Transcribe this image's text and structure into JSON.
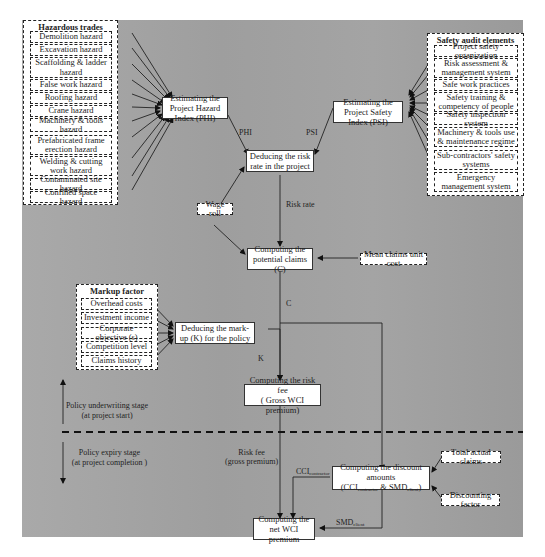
{
  "hazardous_trades": {
    "title": "Hazardous trades",
    "items": [
      "Demolition hazard",
      "Excavation hazard",
      "Scaffolding & ladder hazard",
      "False work hazard",
      "Roofing hazard",
      "Crane hazard",
      "Machinery & tools hazard",
      "Prefabricated frame erection hazard",
      "Welding & cutting work hazard",
      "Contaminated site hazard",
      "Confined space hazard"
    ]
  },
  "safety_audit": {
    "title": "Safety audit elements",
    "items": [
      "Project safety organization",
      "Risk assessment & management system",
      "Safe work practices",
      "Safety training & competency of people",
      "Safety inspection system",
      "Machinery & tools use & maintenance regime",
      "Sub-contractors' safety systems",
      "Emergency management system"
    ]
  },
  "markup_factor": {
    "title": "Markup factor",
    "items": [
      "Overhead costs",
      "Investment income",
      "Corporate objective (s)",
      "Competition level",
      "Claims history"
    ]
  },
  "process": {
    "phi": "Estimating the Project Hazard Index (PHI)",
    "psi": "Estimating the Project Safety Index (PSI)",
    "risk_rate": "Deducing the risk rate in the project",
    "potential_claims": "Computing the potential claims (C)",
    "markup": "Deducing the mark-up (K) for the policy",
    "risk_fee_line1": "Computing the risk fee",
    "risk_fee_line2": "( Gross WCI premium)",
    "discount_line1": "Computing the discount amounts",
    "discount_line2_a": "(CCI",
    "discount_line2_sub1": "contractor",
    "discount_line2_b": " & SMD",
    "discount_line2_sub2": "client",
    "discount_line2_c": ")",
    "net_premium": "Computing the net WCI premium"
  },
  "inputs": {
    "wage_roll": "Wage roll",
    "mean_claims_unit_cost": "Mean claims unit cost",
    "total_actual_claims": "Total actual claims",
    "discounting_factor": "Discounting factor"
  },
  "edge_labels": {
    "phi": "PHI",
    "psi": "PSI",
    "risk_rate": "Risk rate",
    "c": "C",
    "k": "K",
    "risk_fee_1": "Risk fee",
    "risk_fee_2": "(gross premium)",
    "cci": "CCI",
    "cci_sub": "contractor",
    "smd": "SMD",
    "smd_sub": "client"
  },
  "stages": {
    "underwriting_1": "Policy underwriting stage",
    "underwriting_2": "(at project start)",
    "expiry_1": "Policy expiry stage",
    "expiry_2": "(at project completion )"
  },
  "colors": {
    "background": "#a3a3a3",
    "box_fill": "#ffffff",
    "line": "#222222"
  }
}
